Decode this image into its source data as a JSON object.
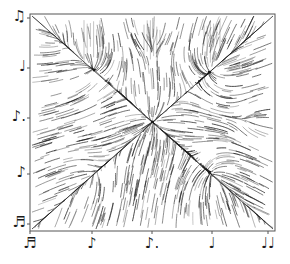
{
  "figure": {
    "type": "rhythm-space flow diagram",
    "frame": {
      "x0": 30,
      "y0": 14,
      "x1": 275,
      "y1": 231,
      "stroke": "#555555"
    },
    "ink_color": "#1a1a1a",
    "x_axis": {
      "ticks": [
        {
          "pos": 30,
          "glyph": "♬",
          "name": "sixteenth-note"
        },
        {
          "pos": 92,
          "glyph": "♪",
          "name": "eighth-note"
        },
        {
          "pos": 152,
          "glyph": "♪.",
          "name": "dotted-eighth-note"
        },
        {
          "pos": 212,
          "glyph": "♩",
          "name": "quarter-note"
        },
        {
          "pos": 268,
          "glyph": "♩♩",
          "name": "tied-notes"
        }
      ]
    },
    "y_axis": {
      "ticks": [
        {
          "pos": 18,
          "glyph": "♫",
          "name": "tied-eighth-notes"
        },
        {
          "pos": 68,
          "glyph": "♩",
          "name": "quarter-note"
        },
        {
          "pos": 118,
          "glyph": "♪.",
          "name": "dotted-eighth-note"
        },
        {
          "pos": 174,
          "glyph": "♪",
          "name": "eighth-note"
        },
        {
          "pos": 224,
          "glyph": "♬",
          "name": "sixteenth-note"
        }
      ]
    },
    "attractors": [
      {
        "x": 152,
        "y": 122,
        "strength": 1.0
      },
      {
        "x": 212,
        "y": 70,
        "strength": 0.8
      },
      {
        "x": 92,
        "y": 68,
        "strength": 0.6
      },
      {
        "x": 212,
        "y": 175,
        "strength": 0.7
      },
      {
        "x": 60,
        "y": 40,
        "strength": 0.4
      },
      {
        "x": 92,
        "y": 175,
        "strength": 0.4
      },
      {
        "x": 250,
        "y": 120,
        "strength": 0.4
      },
      {
        "x": 152,
        "y": 40,
        "strength": 0.35
      }
    ],
    "ridges": [
      {
        "x1": 32,
        "y1": 16,
        "x2": 273,
        "y2": 229
      },
      {
        "x1": 32,
        "y1": 229,
        "x2": 273,
        "y2": 16
      },
      {
        "x1": 92,
        "y1": 68,
        "x2": 212,
        "y2": 175
      }
    ],
    "grid_guides": [
      92,
      152,
      212
    ]
  }
}
